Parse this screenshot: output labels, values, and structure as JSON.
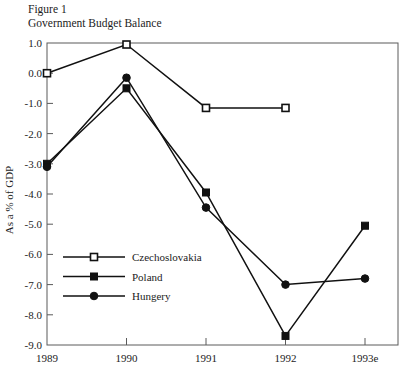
{
  "figure": {
    "caption_line1": "Figure 1",
    "caption_line2": "Government Budget Balance"
  },
  "chart_data": {
    "type": "line",
    "title": "Government Budget Balance",
    "subtitle": "Figure 1",
    "xlabel": "",
    "ylabel": "As a % of GDP",
    "categories": [
      "1989",
      "1990",
      "1991",
      "1992",
      "1993e"
    ],
    "ylim": [
      -9.0,
      1.0
    ],
    "ytick_labels": [
      "1.0",
      "0.0",
      "-1.0",
      "-2.0",
      "-3.0",
      "-4.0",
      "-5.0",
      "-6.0",
      "-7.0",
      "-8.0",
      "-9.0"
    ],
    "yticks": [
      1.0,
      0.0,
      -1.0,
      -2.0,
      -3.0,
      -4.0,
      -5.0,
      -6.0,
      -7.0,
      -8.0,
      -9.0
    ],
    "grid": false,
    "legend_position": "inside-lower-left",
    "series": [
      {
        "name": "Czechoslovakia",
        "marker": "open-square",
        "color": "#111111",
        "x": [
          "1989",
          "1990",
          "1991",
          "1992"
        ],
        "values": [
          0.0,
          0.95,
          -1.15,
          -1.15
        ]
      },
      {
        "name": "Poland",
        "marker": "filled-square",
        "color": "#111111",
        "x": [
          "1989",
          "1990",
          "1991",
          "1992",
          "1993e"
        ],
        "values": [
          -3.0,
          -0.5,
          -3.95,
          -8.7,
          -5.05
        ]
      },
      {
        "name": "Hungery",
        "marker": "filled-circle",
        "color": "#111111",
        "x": [
          "1989",
          "1990",
          "1991",
          "1992",
          "1993e"
        ],
        "values": [
          -3.1,
          -0.15,
          -4.45,
          -7.0,
          -6.8
        ]
      }
    ]
  }
}
